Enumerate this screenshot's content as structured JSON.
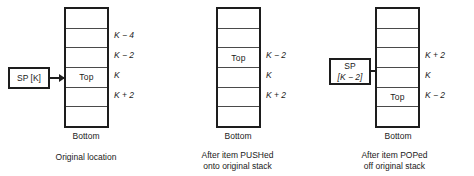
{
  "diagram": {
    "colors": {
      "outline": "#1d1d1d",
      "divider": "#4a4a4a",
      "background": "#ffffff",
      "text": "#1a1a1a"
    },
    "panels": [
      {
        "id": "original",
        "sp_box": {
          "lines": [
            "SP [K]"
          ],
          "label": "SP [K]"
        },
        "stack": {
          "cells": [
            "",
            "",
            "",
            "Top",
            "",
            ""
          ],
          "top_index": 3,
          "addresses": [
            {
              "cell_index": 1,
              "text": "K − 4"
            },
            {
              "cell_index": 2,
              "text": "K − 2"
            },
            {
              "cell_index": 3,
              "text": "K"
            },
            {
              "cell_index": 4,
              "text": "K + 2"
            }
          ],
          "bottom_label": "Bottom"
        },
        "caption": [
          "Original location"
        ]
      },
      {
        "id": "after-push",
        "sp_box": {
          "lines": [
            "SP",
            "[K − 2]"
          ],
          "label": "SP [K − 2]"
        },
        "stack": {
          "cells": [
            "",
            "",
            "Top",
            "",
            "",
            ""
          ],
          "top_index": 2,
          "addresses": [
            {
              "cell_index": 2,
              "text": "K − 2"
            },
            {
              "cell_index": 3,
              "text": "K"
            },
            {
              "cell_index": 4,
              "text": "K + 2"
            }
          ],
          "bottom_label": "Bottom"
        },
        "caption": [
          "After item PUSHed",
          "onto original stack"
        ]
      },
      {
        "id": "after-pop",
        "sp_box": {
          "lines": [
            "SP",
            "[K + 2]"
          ],
          "label": "SP [K + 2]"
        },
        "stack": {
          "cells": [
            "",
            "",
            "",
            "",
            "Top",
            ""
          ],
          "top_index": 4,
          "addresses": [
            {
              "cell_index": 2,
              "text": "K + 2"
            },
            {
              "cell_index": 3,
              "text": "K"
            },
            {
              "cell_index": 4,
              "text": "K − 2"
            }
          ],
          "bottom_label": "Bottom"
        },
        "caption": [
          "After item POPed",
          "off original stack"
        ]
      }
    ]
  }
}
